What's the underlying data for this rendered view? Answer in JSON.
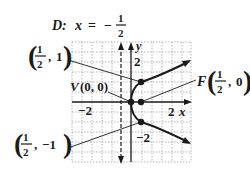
{
  "title": {
    "prefix": "D:",
    "var": "x",
    "eq": "=",
    "sign": "−",
    "num": "1",
    "den": "2"
  },
  "axes": {
    "x_label": "x",
    "y_label": "y",
    "x_ticks": [
      "−2",
      "2"
    ],
    "y_ticks": [
      "2",
      "−2"
    ]
  },
  "points": {
    "vertex": {
      "name": "V",
      "coords": "(0, 0)"
    },
    "focus": {
      "name": "F",
      "num": "1",
      "den": "2",
      "y": "0"
    },
    "upper": {
      "num": "1",
      "den": "2",
      "y": "1"
    },
    "lower": {
      "num": "1",
      "den": "2",
      "y": "−1"
    }
  },
  "colors": {
    "ink": "#1a1a1a",
    "grid": "#9a9a9a",
    "background": "#ffffff"
  }
}
